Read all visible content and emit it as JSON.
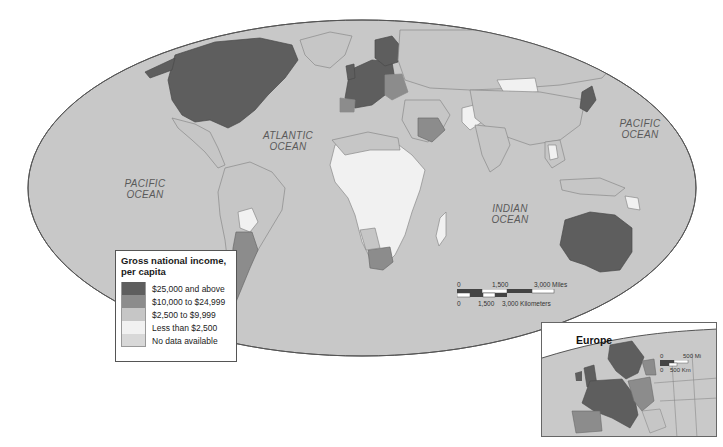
{
  "map": {
    "title": "Gross national income, per capita",
    "projection": "elliptical world",
    "colors": {
      "ocean": "#c8c8c8",
      "outline": "#555555",
      "border": "#8a8a8a",
      "background": "#ffffff"
    },
    "ocean_labels": [
      {
        "line1": "ATLANTIC",
        "line2": "OCEAN"
      },
      {
        "line1": "PACIFIC",
        "line2": "OCEAN"
      },
      {
        "line1": "PACIFIC",
        "line2": "OCEAN"
      },
      {
        "line1": "INDIAN",
        "line2": "OCEAN"
      }
    ],
    "regions": [
      {
        "name": "North America (USA/Canada)",
        "category": "$25,000 and above"
      },
      {
        "name": "Western Europe",
        "category": "$25,000 and above"
      },
      {
        "name": "Scandinavia",
        "category": "$25,000 and above"
      },
      {
        "name": "Japan",
        "category": "$25,000 and above"
      },
      {
        "name": "Australia",
        "category": "$25,000 and above"
      },
      {
        "name": "Saudi Arabia",
        "category": "$10,000 to $24,999"
      },
      {
        "name": "Argentina / Chile",
        "category": "$10,000 to $24,999"
      },
      {
        "name": "South Africa",
        "category": "$10,000 to $24,999"
      },
      {
        "name": "Spain / Portugal",
        "category": "$10,000 to $24,999"
      },
      {
        "name": "Eastern Europe",
        "category": "$10,000 to $24,999"
      },
      {
        "name": "Sub-Saharan Africa",
        "category": "Less than $2,500"
      },
      {
        "name": "Mongolia",
        "category": "Less than $2,500"
      },
      {
        "name": "Bolivia",
        "category": "Less than $2,500"
      },
      {
        "name": "Pakistan",
        "category": "Less than $2,500"
      },
      {
        "name": "Madagascar",
        "category": "Less than $2,500"
      }
    ]
  },
  "legend": {
    "title_line1": "Gross national income,",
    "title_line2": "per capita",
    "items": [
      {
        "label": "$25,000 and above",
        "color": "#5e5e5e"
      },
      {
        "label": "$10,000 to $24,999",
        "color": "#8c8c8c"
      },
      {
        "label": "$2,500 to $9,999",
        "color": "#c6c6c6"
      },
      {
        "label": "Less than $2,500",
        "color": "#f1f1f1"
      },
      {
        "label": "No data available",
        "color": "#d8d8d8"
      }
    ]
  },
  "scale_bar": {
    "miles_zero": "0",
    "miles_mid": "1,500",
    "miles_end": "3,000 Miles",
    "km_zero": "0",
    "km_mid": "1,500",
    "km_end": "3,000 Kilometers"
  },
  "inset": {
    "title": "Europe",
    "scale_mi_zero": "0",
    "scale_mi": "500 Mi",
    "scale_km_zero": "0",
    "scale_km": "500 Km"
  }
}
